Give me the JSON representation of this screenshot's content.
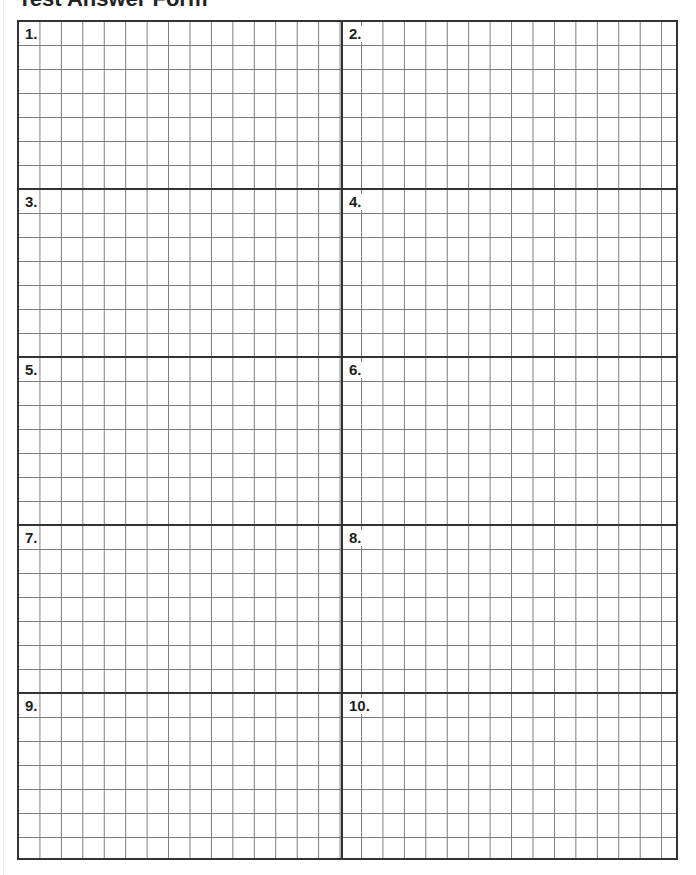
{
  "page": {
    "title": "Test Answer Form"
  },
  "grid": {
    "columns_per_half": [
      15,
      16
    ],
    "rows_per_box": 7,
    "line_color": "#7a7a7a",
    "divider_color": "#333333"
  },
  "answers": [
    {
      "label": "1."
    },
    {
      "label": "2."
    },
    {
      "label": "3."
    },
    {
      "label": "4."
    },
    {
      "label": "5."
    },
    {
      "label": "6."
    },
    {
      "label": "7."
    },
    {
      "label": "8."
    },
    {
      "label": "9."
    },
    {
      "label": "10."
    }
  ]
}
